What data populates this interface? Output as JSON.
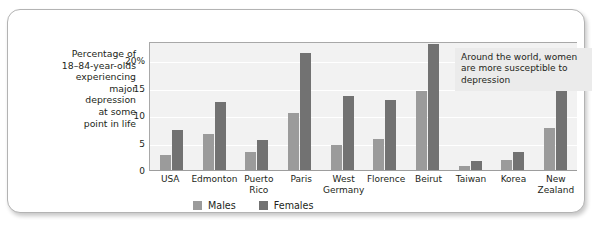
{
  "chart_data": {
    "type": "bar",
    "title": "",
    "ylabel": "Percentage of 18–84-year-olds experiencing major depression at some point in life",
    "xlabel": "",
    "ylim": [
      0,
      23.5
    ],
    "yticks": [
      "0",
      "5",
      "10",
      "15",
      "20%"
    ],
    "ytick_values": [
      0,
      5,
      10,
      15,
      20
    ],
    "grid": true,
    "legend_position": "bottom",
    "categories": [
      "USA",
      "Edmonton",
      "Puerto Rico",
      "Paris",
      "West Germany",
      "Florence",
      "Beirut",
      "Taiwan",
      "Korea",
      "New Zealand"
    ],
    "series": [
      {
        "name": "Males",
        "color": "#9b9b9b",
        "values": [
          2.7,
          6.5,
          3.2,
          10.4,
          4.5,
          5.6,
          14.4,
          0.8,
          1.8,
          7.6
        ]
      },
      {
        "name": "Females",
        "color": "#727272",
        "values": [
          7.3,
          12.4,
          5.4,
          21.3,
          13.4,
          12.8,
          23.0,
          1.6,
          3.3,
          15.3
        ]
      }
    ],
    "annotations": [
      {
        "text": "Around the world, women are more susceptible to depression"
      }
    ]
  },
  "ylabel_lines": [
    "Percentage of",
    "18–84-year-olds",
    "experiencing",
    "major",
    "depression",
    "at some",
    "point in life"
  ],
  "colors": {
    "males": "#9b9b9b",
    "females": "#727272",
    "plot_background": "#f2f2f2",
    "annotation_background": "#ebebeb",
    "frame_border": "#b3b3b3"
  }
}
